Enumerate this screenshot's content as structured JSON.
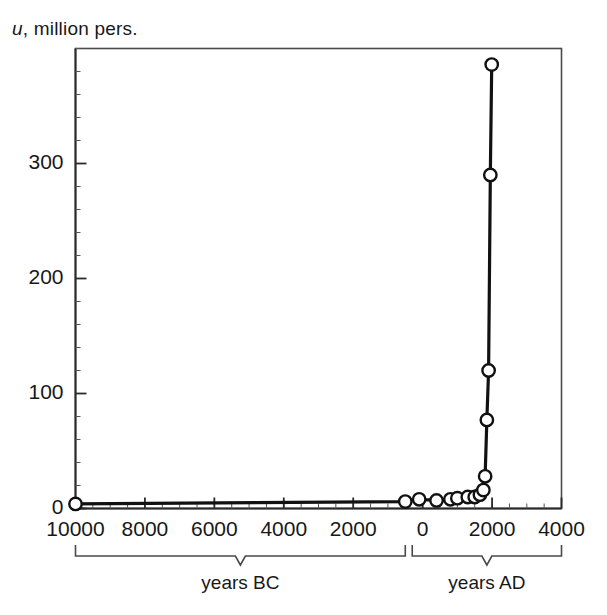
{
  "chart_data": {
    "type": "line",
    "title": "",
    "subtitle": "",
    "ylabel": "u, million pers.",
    "ylabel_italic_part": "u",
    "ylabel_rest": ", million pers.",
    "xlabel": "",
    "xlim": [
      -10000,
      4000
    ],
    "ylim": [
      0,
      400
    ],
    "grid": false,
    "legend": null,
    "marker": "open-circle",
    "line_color": "#111111",
    "marker_fill": "#ffffff",
    "x_tick_values": [
      -10000,
      -8000,
      -6000,
      -4000,
      -2000,
      0,
      2000,
      4000
    ],
    "x_tick_labels": [
      "10000",
      "8000",
      "6000",
      "4000",
      "2000",
      "0",
      "2000",
      "4000"
    ],
    "y_tick_values": [
      0,
      100,
      200,
      300
    ],
    "y_tick_labels": [
      "0",
      "100",
      "200",
      "300"
    ],
    "x_minor_spacing": 500,
    "y_minor_spacing": 20,
    "axis_bracket_labels": [
      {
        "name": "years-bc",
        "label": "years BC",
        "from": -10000,
        "to": -500
      },
      {
        "name": "years-ad",
        "label": "years AD",
        "from": -300,
        "to": 4000
      }
    ],
    "series": [
      {
        "name": "world population",
        "x": [
          -10000,
          -500,
          -100,
          400,
          800,
          1000,
          1300,
          1500,
          1650,
          1750,
          1800,
          1850,
          1900,
          1950,
          1990
        ],
        "y": [
          4,
          6,
          8,
          7,
          8,
          9,
          10,
          10,
          12,
          16,
          28,
          77,
          120,
          290,
          386
        ]
      }
    ],
    "data_points": [
      {
        "x": -10000,
        "y": 4
      },
      {
        "x": -500,
        "y": 6
      },
      {
        "x": -100,
        "y": 8
      },
      {
        "x": 400,
        "y": 7
      },
      {
        "x": 800,
        "y": 8
      },
      {
        "x": 1000,
        "y": 9
      },
      {
        "x": 1300,
        "y": 10
      },
      {
        "x": 1500,
        "y": 10
      },
      {
        "x": 1650,
        "y": 12
      },
      {
        "x": 1750,
        "y": 16
      },
      {
        "x": 1800,
        "y": 28
      },
      {
        "x": 1850,
        "y": 77
      },
      {
        "x": 1900,
        "y": 120
      },
      {
        "x": 1950,
        "y": 290
      },
      {
        "x": 1990,
        "y": 386
      }
    ]
  },
  "axis": {
    "y_title": "u, million pers.",
    "y_title_italic": "u",
    "y_title_tail": ", million pers."
  }
}
